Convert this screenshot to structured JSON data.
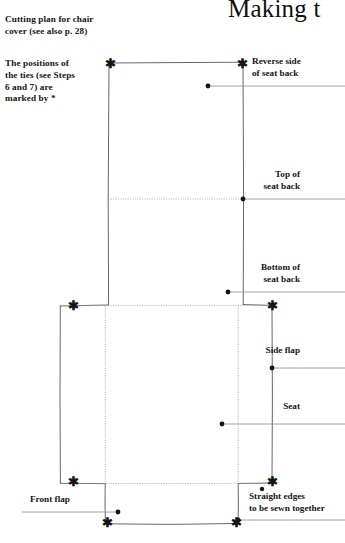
{
  "page": {
    "width": 345,
    "height": 543,
    "background": "#ffffff",
    "ink_color": "#151515",
    "line_color": "#4a4a52",
    "fold_line_color": "#9a9aa2"
  },
  "chapter_title": "Making t",
  "captions": {
    "cutting_plan": "Cutting plan for chair\ncover (see also p. 28)",
    "positions_of_ties": "The positions of\nthe ties (see Steps\n6 and 7) are\nmarked by *"
  },
  "callouts": [
    {
      "id": "reverse-side-of-seat-back",
      "label": "Reverse side\nof seat back",
      "align": "left",
      "x": 252,
      "y": 56,
      "leader": {
        "from_x": 208,
        "from_y": 86,
        "to_x": 345,
        "to_y": 86,
        "dot": true
      }
    },
    {
      "id": "top-of-seat-back",
      "label": "Top of\nseat back",
      "align": "right",
      "x": 275,
      "y": 170,
      "leader": {
        "from_x": 243,
        "from_y": 199,
        "to_x": 345,
        "to_y": 199,
        "dot": true
      }
    },
    {
      "id": "bottom-of-seat-back",
      "label": "Bottom of\nseat back",
      "align": "right",
      "x": 275,
      "y": 263,
      "leader": {
        "from_x": 228,
        "from_y": 292,
        "to_x": 345,
        "to_y": 292,
        "dot": true
      }
    },
    {
      "id": "side-flap",
      "label": "Side flap",
      "align": "right",
      "x": 296,
      "y": 345,
      "leader": {
        "from_x": 272,
        "from_y": 368,
        "to_x": 345,
        "to_y": 368,
        "dot": true
      }
    },
    {
      "id": "seat",
      "label": "Seat",
      "align": "right",
      "x": 300,
      "y": 401,
      "leader": {
        "from_x": 222,
        "from_y": 424,
        "to_x": 345,
        "to_y": 424,
        "dot": true
      }
    },
    {
      "id": "straight-edges",
      "label": "Straight edges\nto be sewn together",
      "align": "left",
      "x": 250,
      "y": 492,
      "leader": {
        "from_x": 238,
        "from_y": 520,
        "to_x": 345,
        "to_y": 520,
        "dot": true
      }
    },
    {
      "id": "front-flap",
      "label": "Front flap",
      "align": "left",
      "x": 30,
      "y": 494,
      "leader": {
        "from_x": 118,
        "from_y": 512,
        "to_x": 22,
        "to_y": 512,
        "dot": true
      }
    }
  ],
  "diagram": {
    "name": "chair-cover-cutting-plan",
    "upper_panel": {
      "left": 108,
      "top": 63,
      "right": 243,
      "bottom": 305,
      "description": "seat back panel"
    },
    "lower_panel": {
      "left": 60,
      "top": 305,
      "right": 272,
      "bottom": 483,
      "description": "seat and side flaps panel"
    },
    "bottom_flap": {
      "left": 105,
      "top": 483,
      "right": 238,
      "bottom": 524,
      "description": "front flap"
    },
    "fold_lines": [
      {
        "type": "horizontal",
        "y": 199,
        "x1": 108,
        "x2": 243,
        "label": "top of seat back"
      },
      {
        "type": "horizontal",
        "y": 305,
        "x1": 60,
        "x2": 272,
        "label": "bottom of seat back"
      },
      {
        "type": "vertical",
        "x": 105,
        "y1": 305,
        "y2": 483,
        "label": "left seat fold"
      },
      {
        "type": "vertical",
        "x": 238,
        "y1": 305,
        "y2": 483,
        "label": "right seat fold"
      },
      {
        "type": "horizontal",
        "y": 483,
        "x1": 60,
        "x2": 272,
        "label": "front flap fold"
      }
    ],
    "tie_markers": [
      {
        "x": 110,
        "y": 63
      },
      {
        "x": 241,
        "y": 63
      },
      {
        "x": 72,
        "y": 305
      },
      {
        "x": 272,
        "y": 305
      },
      {
        "x": 72,
        "y": 481
      },
      {
        "x": 272,
        "y": 481
      },
      {
        "x": 107,
        "y": 522
      },
      {
        "x": 236,
        "y": 522
      }
    ],
    "marker_glyph": "*"
  }
}
